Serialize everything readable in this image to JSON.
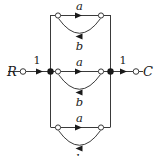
{
  "figure": {
    "name": "cascade-transition-diagram",
    "stroke_color": "#3a3a3a",
    "fill_color": "#1a1a1a",
    "background": "#ffffff",
    "terminals": {
      "input_label": "R",
      "output_label": "C"
    },
    "edge_labels": {
      "input_gain": "1",
      "output_gain": "1",
      "forward_top": "a",
      "feedback_top": "b",
      "forward_middle": "a",
      "feedback_middle": "b",
      "forward_bottom": "a",
      "feedback_bottom": "b"
    },
    "branches": [
      {
        "id": "top",
        "forward": "a",
        "feedback": "b"
      },
      {
        "id": "middle",
        "forward": "a",
        "feedback": "b"
      },
      {
        "id": "bottom",
        "forward": "a",
        "feedback": "b"
      }
    ],
    "nodes": {
      "summing_left": "filled",
      "summing_right": "filled",
      "branch_node": "hollow",
      "terminal_node": "hollow"
    }
  }
}
